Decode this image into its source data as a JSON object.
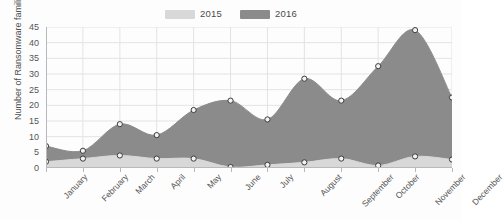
{
  "chart_data": {
    "type": "area",
    "title": "",
    "xlabel": "",
    "ylabel": "Number of Ransomware families",
    "categories": [
      "January",
      "February",
      "March",
      "April",
      "May",
      "June",
      "July",
      "August",
      "September",
      "October",
      "November",
      "December"
    ],
    "series": [
      {
        "name": "2015",
        "color": "#d8d8d8",
        "values": [
          2,
          3,
          4,
          3,
          3,
          0.3,
          1,
          1.8,
          3,
          0.8,
          3.7,
          2.7
        ]
      },
      {
        "name": "2016",
        "color": "#8b8b8b",
        "values": [
          7,
          5.5,
          14,
          10.5,
          18.5,
          21.5,
          15.5,
          28.5,
          21.5,
          32.5,
          44,
          22.5
        ]
      }
    ],
    "ylim": [
      0,
      45
    ],
    "ytick_values": [
      0,
      5,
      10,
      15,
      20,
      25,
      30,
      35,
      40,
      45
    ],
    "grid": true,
    "legend_position": "top-center",
    "markers": "circle"
  },
  "legend": {
    "items": [
      {
        "label": "2015",
        "color": "#d8d8d8"
      },
      {
        "label": "2016",
        "color": "#8b8b8b"
      }
    ]
  },
  "colors": {
    "series_2015": "#d8d8d8",
    "series_2016": "#8b8b8b",
    "grid": "#e3e3e3",
    "axis": "#b9b9b9",
    "text": "#555555",
    "background": "#fdfdfd",
    "marker_fill": "#f2f2f2",
    "marker_stroke": "#3a3a3a"
  }
}
